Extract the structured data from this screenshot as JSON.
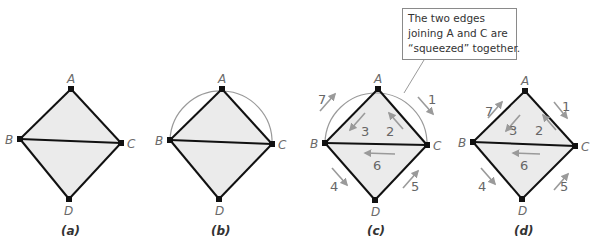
{
  "colors": {
    "fill": "#ebebeb",
    "edge": "#111111",
    "arc": "#9a9a9a",
    "arrow": "#9a9a9a",
    "label": "#6a6a6a"
  },
  "diagrams": [
    {
      "caption": "(a)",
      "vertices": {
        "A": "A",
        "B": "B",
        "C": "C",
        "D": "D"
      }
    },
    {
      "caption": "(b)",
      "vertices": {
        "A": "A",
        "B": "B",
        "C": "C",
        "D": "D"
      }
    },
    {
      "caption": "(c)",
      "vertices": {
        "A": "A",
        "B": "B",
        "C": "C",
        "D": "D"
      },
      "steps": [
        "1",
        "2",
        "3",
        "4",
        "5",
        "6",
        "7"
      ]
    },
    {
      "caption": "(d)",
      "vertices": {
        "A": "A",
        "B": "B",
        "C": "C",
        "D": "D"
      },
      "steps": [
        "1",
        "2",
        "3",
        "4",
        "5",
        "6",
        "7"
      ]
    }
  ],
  "callout": {
    "line1": "The two edges",
    "line2": "joining A and C are",
    "line3": "“squeezed” together."
  }
}
